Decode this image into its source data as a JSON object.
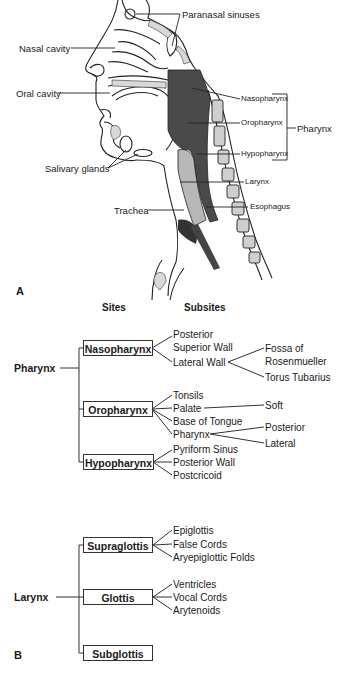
{
  "panel_a": {
    "letter": "A",
    "labels": {
      "paranasal_sinuses": "Paranasal sinuses",
      "nasal_cavity": "Nasal cavity",
      "oral_cavity": "Oral cavity",
      "salivary_glands": "Salivary glands",
      "trachea": "Trachea",
      "nasopharynx": "Nasopharynx",
      "oropharynx": "Oropharynx",
      "hypopharynx": "Hypopharynx",
      "pharynx": "Pharynx",
      "larynx": "Larynx",
      "esophagus": "Esophagus"
    }
  },
  "panel_b": {
    "letter": "B",
    "headers": {
      "sites": "Sites",
      "subsites": "Subsites"
    },
    "pharynx": {
      "label": "Pharynx",
      "sites": [
        {
          "name": "Nasopharynx",
          "subsites": [
            "Posterior",
            "Superior Wall",
            "Lateral Wall"
          ],
          "lateral_wall_children": [
            "Fossa of",
            "Rosenmueller",
            "Torus Tubarius"
          ]
        },
        {
          "name": "Oropharynx",
          "subsites": [
            "Tonsils",
            "Palate",
            "Base of Tongue",
            "Pharynx"
          ],
          "palate_children": [
            "Soft"
          ],
          "pharynx_children": [
            "Posterior",
            "Lateral"
          ]
        },
        {
          "name": "Hypopharynx",
          "subsites": [
            "Pyriform Sinus",
            "Posterior Wall",
            "Postcricoid"
          ]
        }
      ]
    },
    "larynx": {
      "label": "Larynx",
      "sites": [
        {
          "name": "Supraglottis",
          "subsites": [
            "Epiglottis",
            "False Cords",
            "Aryepiglottic Folds"
          ]
        },
        {
          "name": "Glottis",
          "subsites": [
            "Ventricles",
            "Vocal Cords",
            "Arytenoids"
          ]
        },
        {
          "name": "Subglottis",
          "subsites": []
        }
      ]
    }
  }
}
